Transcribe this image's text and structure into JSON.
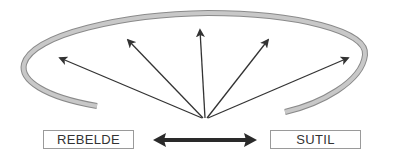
{
  "diagram": {
    "left_label": "REBELDE",
    "right_label": "SUTIL",
    "colors": {
      "arc_fill": "#c8c8c8",
      "arc_stroke": "#8a8a8a",
      "arrow": "#333333",
      "double_arrow": "#2a2a2a",
      "box_border": "#9a9a9a",
      "text": "#333333"
    },
    "arrows": [
      {
        "from": [
          202,
          118
        ],
        "to": [
          60,
          58
        ]
      },
      {
        "from": [
          203,
          118
        ],
        "to": [
          128,
          40
        ]
      },
      {
        "from": [
          205,
          118
        ],
        "to": [
          200,
          30
        ]
      },
      {
        "from": [
          207,
          118
        ],
        "to": [
          268,
          40
        ]
      },
      {
        "from": [
          208,
          118
        ],
        "to": [
          348,
          58
        ]
      }
    ],
    "spectrum_arrow": {
      "from": [
        153,
        140
      ],
      "to": [
        257,
        140
      ],
      "type": "double-headed"
    }
  }
}
